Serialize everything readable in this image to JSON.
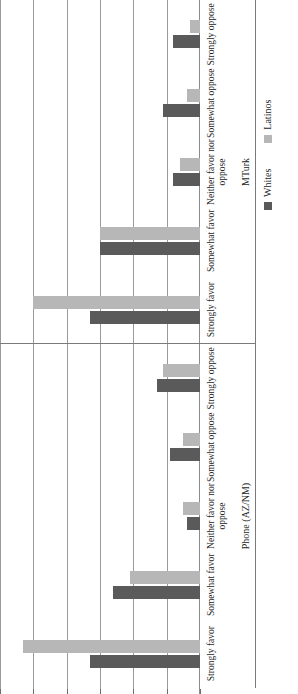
{
  "chart_data": {
    "type": "bar",
    "title": "",
    "xlabel": "",
    "ylabel": "",
    "orientation": "horizontal-rotated",
    "ylim": [
      0,
      60
    ],
    "yticks": [
      0,
      10,
      20,
      30,
      40,
      50,
      60
    ],
    "ytick_labels": [
      "0",
      "10",
      "20",
      "30",
      "40",
      "50",
      "60"
    ],
    "grid": true,
    "legend_position": "bottom-right",
    "categories": [
      "Strongly favor",
      "Somewhat favor",
      "Neither favor nor oppose",
      "Somewhat oppose",
      "Strongly oppose"
    ],
    "panels": [
      {
        "name": "Phone (AZ/NM)",
        "series": [
          {
            "name": "Whites",
            "values": [
              33,
              26,
              4,
              9,
              13
            ]
          },
          {
            "name": "Latinos",
            "values": [
              53,
              21,
              5,
              5,
              11
            ]
          }
        ]
      },
      {
        "name": "MTurk",
        "series": [
          {
            "name": "Whites",
            "values": [
              33,
              30,
              8,
              11,
              8
            ]
          },
          {
            "name": "Latinos",
            "values": [
              50,
              30,
              6,
              4,
              3
            ]
          }
        ]
      }
    ],
    "series_colors": {
      "Whites": "#5a5a5a",
      "Latinos": "#b7b7b7"
    }
  },
  "legend": {
    "items": [
      {
        "label": "Whites",
        "color": "#5a5a5a"
      },
      {
        "label": "Latinos",
        "color": "#b7b7b7"
      }
    ]
  }
}
